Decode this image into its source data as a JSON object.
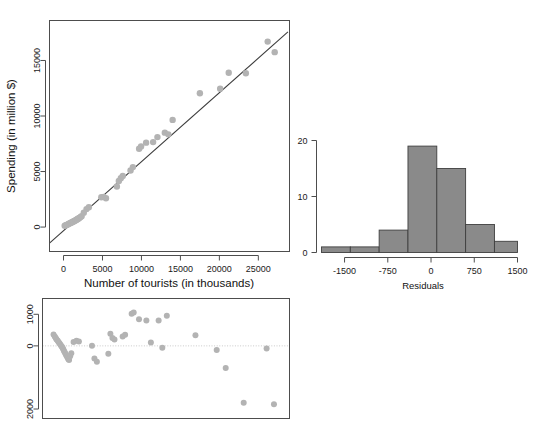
{
  "figure": {
    "title": "",
    "background": "#ffffff",
    "point_color": "#b3b3b3",
    "line_color": "#3b3b3b",
    "bar_color": "#8a8a8a",
    "bar_border_color": "#3f3f3f"
  },
  "panels": {
    "scatter": {
      "name": "Tourists vs Spending scatter with regression line",
      "xlabel": "Number of tourists (in thousands)",
      "ylabel": "Spending (in million $)",
      "xticks": [
        "0",
        "5000",
        "10000",
        "15000",
        "20000",
        "25000"
      ],
      "yticks": [
        "0",
        "5000",
        "10000",
        "15000"
      ]
    },
    "histogram": {
      "name": "Histogram of residuals",
      "xlabel": "Residuals",
      "ylabel": "",
      "xticks": [
        "-1500",
        "-750",
        "0",
        "750",
        "1500"
      ],
      "yticks": [
        "0",
        "10",
        "20"
      ]
    },
    "residuals": {
      "name": "Residuals vs fitted plot",
      "xlabel": "",
      "ylabel": "",
      "xticks": [],
      "yticks": [
        "1000",
        "0",
        "2000"
      ]
    }
  },
  "chart_data": [
    {
      "type": "scatter",
      "id": "tourists-vs-spending",
      "title": "",
      "xlabel": "Number of tourists (in thousands)",
      "ylabel": "Spending (in million $)",
      "xlim": [
        -1800,
        29000
      ],
      "ylim": [
        -2200,
        18600
      ],
      "xticks": [
        0,
        5000,
        10000,
        15000,
        20000,
        25000
      ],
      "yticks": [
        0,
        5000,
        10000,
        15000
      ],
      "grid": false,
      "legend": null,
      "marker": {
        "shape": "circle",
        "color": "#b3b3b3",
        "size": 3.2
      },
      "fit_line": {
        "type": "linear-regression",
        "color": "#3b3b3b",
        "slope": 0.6215,
        "intercept": -330,
        "x_start": -1800,
        "x_end": 28800
      },
      "x": [
        150,
        300,
        420,
        520,
        640,
        760,
        880,
        980,
        1080,
        1180,
        1260,
        1340,
        1430,
        1520,
        1610,
        1700,
        1790,
        1880,
        1960,
        2050,
        2180,
        2320,
        2600,
        2950,
        3250,
        4850,
        5150,
        5450,
        6850,
        7100,
        7350,
        7600,
        8600,
        8900,
        9700,
        9950,
        10600,
        11500,
        12050,
        13000,
        13450,
        14000,
        17500,
        20100,
        21200,
        23400,
        26200,
        27100
      ],
      "y": [
        120,
        160,
        200,
        230,
        280,
        320,
        360,
        400,
        430,
        470,
        500,
        520,
        560,
        600,
        640,
        680,
        710,
        750,
        790,
        830,
        900,
        980,
        1300,
        1620,
        1780,
        2680,
        2720,
        2600,
        3650,
        4150,
        4400,
        4600,
        5100,
        5400,
        7050,
        7250,
        7600,
        7650,
        8100,
        8500,
        8350,
        9650,
        12050,
        12450,
        13900,
        13850,
        16700,
        15750
      ],
      "points_note": "48 country observations; dense overlapping cluster near the origin"
    },
    {
      "type": "bar",
      "id": "residuals-histogram",
      "title": "",
      "xlabel": "Residuals",
      "ylabel": "",
      "xlim": [
        -1900,
        1500
      ],
      "ylim": [
        0,
        20
      ],
      "xticks": [
        -1500,
        -750,
        0,
        750,
        1500
      ],
      "yticks": [
        0,
        10,
        20
      ],
      "grid": false,
      "legend": null,
      "bin_edges": [
        -1900,
        -1400,
        -900,
        -400,
        100,
        600,
        1100,
        1500
      ],
      "bin_labels": [
        "-1900 to -1400",
        "-1400 to -900",
        "-900 to -400",
        "-400 to 100",
        "100 to 600",
        "600 to 1100",
        "1100 to 1500"
      ],
      "categories": [
        "bin1",
        "bin2",
        "bin3",
        "bin4",
        "bin5",
        "bin6",
        "bin7"
      ],
      "values": [
        1,
        1,
        4,
        19,
        15,
        5,
        2
      ]
    },
    {
      "type": "scatter",
      "id": "residuals-vs-fitted",
      "title": "",
      "xlabel": "",
      "ylabel": "",
      "xlim": [
        -1200,
        29000
      ],
      "ylim": [
        -2300,
        1500
      ],
      "xticks": [],
      "yticks": [
        1000,
        0,
        -2000
      ],
      "ytick_labels": [
        "1000",
        "0",
        "2000"
      ],
      "grid": false,
      "legend": null,
      "marker": {
        "shape": "circle",
        "color": "#b3b3b3",
        "size": 3.0
      },
      "reference_line": {
        "y": 0,
        "style": "dotted",
        "color": "#c9c9c9"
      },
      "x": [
        150,
        300,
        420,
        520,
        640,
        760,
        880,
        980,
        1080,
        1180,
        1260,
        1340,
        1430,
        1520,
        1610,
        1700,
        1790,
        1880,
        1960,
        2050,
        2180,
        2320,
        2600,
        2950,
        3250,
        4850,
        5150,
        5450,
        6850,
        7100,
        7350,
        7600,
        8600,
        8900,
        9700,
        9950,
        10600,
        11500,
        12050,
        13000,
        13450,
        14000,
        17500,
        20100,
        21200,
        23400,
        26200,
        27100
      ],
      "y": [
        360,
        300,
        250,
        200,
        170,
        120,
        80,
        40,
        0,
        -30,
        -70,
        -110,
        -160,
        -200,
        -250,
        -300,
        -340,
        -380,
        -420,
        -450,
        -330,
        -230,
        120,
        160,
        140,
        0,
        -400,
        -500,
        -250,
        380,
        250,
        200,
        300,
        350,
        1020,
        1060,
        840,
        800,
        110,
        800,
        -60,
        950,
        340,
        -130,
        -700,
        -1800,
        -80,
        -1850
      ]
    }
  ]
}
